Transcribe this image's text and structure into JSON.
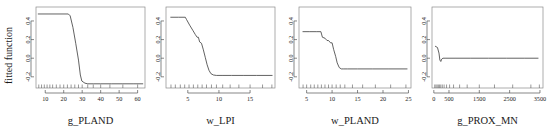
{
  "figure": {
    "ylabel": "fitted function",
    "background": "#ffffff",
    "line_color": "#3a3a3a",
    "axis_color": "#555555",
    "frame_color": "#8a8a8a",
    "panel_count": 4
  },
  "chart_data": [
    {
      "type": "line",
      "title": "",
      "xlabel": "g_PLAND",
      "ylabel": "fitted function",
      "xlim": [
        5,
        64
      ],
      "ylim": [
        -0.32,
        0.55
      ],
      "xticks": [
        10,
        20,
        30,
        40,
        50,
        60
      ],
      "yticks": [
        -0.2,
        0.0,
        0.2,
        0.4
      ],
      "ytick_labels": [
        "-0.2",
        "0.0",
        "0.2",
        "0.4"
      ],
      "grid": false,
      "legend": "none",
      "x": [
        6,
        12,
        18,
        22.5,
        23.5,
        25,
        26.5,
        28,
        29,
        29.8,
        30.5,
        31.5,
        33,
        36,
        40,
        46,
        52,
        58,
        63
      ],
      "values": [
        0.475,
        0.475,
        0.475,
        0.475,
        0.455,
        0.33,
        0.16,
        -0.02,
        -0.18,
        -0.245,
        -0.255,
        -0.268,
        -0.275,
        -0.275,
        -0.275,
        -0.275,
        -0.275,
        -0.275,
        -0.275
      ],
      "rug_x": [
        6.5,
        8,
        9.5,
        11,
        12.5,
        14,
        16,
        18,
        20,
        22,
        24,
        26,
        28,
        30,
        33,
        36,
        40,
        45,
        52,
        60
      ]
    },
    {
      "type": "line",
      "title": "",
      "xlabel": "w_LPI",
      "ylabel": "fitted function",
      "xlim": [
        1.5,
        19
      ],
      "ylim": [
        -0.32,
        0.55
      ],
      "xticks": [
        5,
        10,
        15
      ],
      "yticks": [
        -0.2,
        0.0,
        0.2,
        0.4
      ],
      "ytick_labels": [
        "-0.2",
        "0.0",
        "0.2",
        "0.4"
      ],
      "grid": false,
      "legend": "none",
      "x": [
        2.2,
        3.5,
        4.6,
        4.8,
        5.3,
        5.8,
        6.2,
        6.5,
        6.7,
        6.9,
        7.2,
        7.5,
        7.8,
        8.1,
        8.4,
        8.7,
        9.1,
        9.6,
        10.5,
        12,
        14,
        16,
        18.6
      ],
      "values": [
        0.44,
        0.44,
        0.44,
        0.415,
        0.355,
        0.3,
        0.255,
        0.225,
        0.225,
        0.175,
        0.16,
        0.09,
        0.01,
        -0.07,
        -0.13,
        -0.165,
        -0.18,
        -0.185,
        -0.185,
        -0.185,
        -0.185,
        -0.185,
        -0.185
      ],
      "rug_x": [
        2.3,
        3.0,
        3.8,
        4.5,
        5.2,
        5.9,
        6.6,
        7.3,
        8.0,
        8.8,
        9.6,
        10.6,
        11.8,
        13.2,
        15.0,
        17.0,
        18.5
      ]
    },
    {
      "type": "line",
      "title": "",
      "xlabel": "w_PLAND",
      "ylabel": "fitted function",
      "xlim": [
        3.5,
        25.5
      ],
      "ylim": [
        -0.32,
        0.55
      ],
      "xticks": [
        5,
        10,
        15,
        20,
        25
      ],
      "yticks": [
        -0.2,
        0.0,
        0.2,
        0.4
      ],
      "ytick_labels": [
        "-0.2",
        "0.0",
        "0.2",
        "0.4"
      ],
      "grid": false,
      "legend": "none",
      "x": [
        4.2,
        5.5,
        7.0,
        7.8,
        8.1,
        8.6,
        9.0,
        9.3,
        9.7,
        10.0,
        10.3,
        10.7,
        11.0,
        11.4,
        11.8,
        12.3,
        13.0,
        15,
        18,
        21,
        24.8
      ],
      "values": [
        0.285,
        0.285,
        0.285,
        0.285,
        0.225,
        0.215,
        0.19,
        0.19,
        0.165,
        0.165,
        0.095,
        0.02,
        -0.05,
        -0.1,
        -0.115,
        -0.115,
        -0.115,
        -0.115,
        -0.115,
        -0.115,
        -0.115
      ],
      "rug_x": [
        4.3,
        5.0,
        5.8,
        6.5,
        7.2,
        7.9,
        8.6,
        9.3,
        10.0,
        10.8,
        11.6,
        12.5,
        14.0,
        16.0,
        18.5,
        21.5,
        24.5
      ]
    },
    {
      "type": "line",
      "title": "",
      "xlabel": "g_PROX_MN",
      "ylabel": "fitted function",
      "xlim": [
        -60,
        3600
      ],
      "ylim": [
        -0.32,
        0.55
      ],
      "xticks": [
        0,
        500,
        1500,
        2500,
        3500
      ],
      "yticks": [
        -0.2,
        0.0,
        0.2,
        0.4
      ],
      "ytick_labels": [
        "-0.2",
        "0.0",
        "0.2",
        "0.4"
      ],
      "grid": false,
      "legend": "none",
      "x": [
        40,
        120,
        170,
        200,
        230,
        260,
        300,
        400,
        700,
        1200,
        1800,
        2400,
        3000,
        3450
      ],
      "values": [
        0.13,
        0.115,
        0.055,
        -0.02,
        -0.035,
        -0.01,
        0.0,
        0.0,
        0.0,
        0.0,
        0.0,
        0.0,
        0.0,
        0.0
      ],
      "rug_x": [
        30,
        70,
        110,
        150,
        190,
        230,
        280,
        340,
        420,
        520,
        650,
        850,
        1100,
        1500,
        2000,
        2600,
        3200,
        3480
      ]
    }
  ]
}
